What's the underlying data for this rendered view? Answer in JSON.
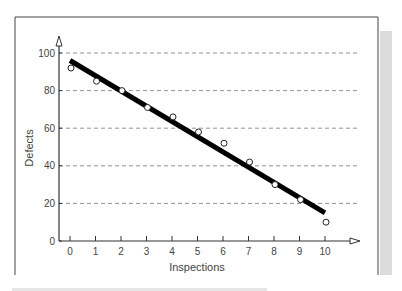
{
  "chart_data": {
    "type": "scatter",
    "title": "",
    "xlabel": "Inspections",
    "ylabel": "Defects",
    "x": [
      0,
      1,
      2,
      3,
      4,
      5,
      6,
      7,
      8,
      9,
      10
    ],
    "series": [
      {
        "name": "observed",
        "marker": "open-circle",
        "values": [
          92,
          85,
          80,
          71,
          66,
          58,
          52,
          42,
          30,
          22,
          10
        ]
      },
      {
        "name": "fitted-line",
        "style": "thick-solid-line",
        "x": [
          0,
          10
        ],
        "values": [
          96,
          15
        ]
      }
    ],
    "xticks": [
      "0",
      "1",
      "2",
      "3",
      "4",
      "5",
      "6",
      "7",
      "8",
      "9",
      "10"
    ],
    "yticks": [
      "0",
      "20",
      "40",
      "60",
      "80",
      "100"
    ],
    "xlim": [
      0,
      11
    ],
    "ylim": [
      0,
      105
    ],
    "grid": {
      "horizontal": true,
      "style": "dashed",
      "at": [
        20,
        40,
        60,
        80,
        100
      ]
    },
    "legend": null
  },
  "colors": {
    "line": "#000000",
    "axis": "#333333",
    "grid": "#777777",
    "frame": "#444444",
    "shade": "#d9d9d9"
  }
}
